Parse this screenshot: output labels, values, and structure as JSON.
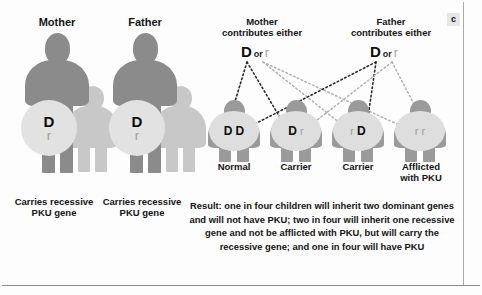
{
  "figure": {
    "panel_letter": "c"
  },
  "parents": [
    {
      "title": "Mother",
      "dominant_allele": "D",
      "recessive_allele": "r",
      "caption": "Carries recessive\nPKU gene"
    },
    {
      "title": "Father",
      "dominant_allele": "D",
      "recessive_allele": "r",
      "caption": "Carries recessive\nPKU gene"
    }
  ],
  "gametes": [
    {
      "title": "Mother\ncontributes either",
      "dominant": "D",
      "conjunction": "or",
      "recessive": "r"
    },
    {
      "title": "Father\ncontributes either",
      "dominant": "D",
      "conjunction": "or",
      "recessive": "r"
    }
  ],
  "offspring": [
    {
      "allele_left": "D",
      "allele_left_type": "dominant",
      "allele_right": "D",
      "allele_right_type": "dominant",
      "label": "Normal"
    },
    {
      "allele_left": "D",
      "allele_left_type": "dominant",
      "allele_right": "r",
      "allele_right_type": "recessive",
      "label": "Carrier"
    },
    {
      "allele_left": "r",
      "allele_left_type": "recessive",
      "allele_right": "D",
      "allele_right_type": "dominant",
      "label": "Carrier"
    },
    {
      "allele_left": "r",
      "allele_left_type": "recessive",
      "allele_right": "r",
      "allele_right_type": "recessive",
      "label": "Afflicted\nwith PKU"
    }
  ],
  "result": {
    "text": "Result: one in four children will inherit two dominant genes and will not have PKU; two in four will inherit one recessive gene and not be afflicted with PKU, but will carry the recessive gene; and one in four will have PKU"
  },
  "colors": {
    "figure_main": "#8b8b8b",
    "figure_shadow": "#c8c8c8",
    "figure_child": "#9a9a9a",
    "allele_circle": "#e2e2e2",
    "dominant_text": "#0d0d0d",
    "recessive_text": "#a5a5a5",
    "rule": "#8d8d8d",
    "background": "#fdfdfd"
  }
}
